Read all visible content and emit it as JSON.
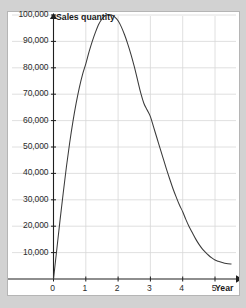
{
  "chart_data": {
    "type": "line",
    "title": "",
    "xlabel": "Year",
    "ylabel": "Sales quantity",
    "xlim": [
      -0.25,
      5.8
    ],
    "ylim": [
      0,
      105000
    ],
    "xticks": [
      "0",
      "1",
      "2",
      "3",
      "4",
      "5"
    ],
    "xtick_values": [
      0,
      1,
      2,
      3,
      4,
      5
    ],
    "yticks": [
      "10,000",
      "20,000",
      "30,000",
      "40,000",
      "50,000",
      "60,000",
      "70,000",
      "80,000",
      "90,000",
      "100,000"
    ],
    "ytick_values": [
      10000,
      20000,
      30000,
      40000,
      50000,
      60000,
      70000,
      80000,
      90000,
      100000
    ],
    "grid": true,
    "legend": "none",
    "series": [
      {
        "name": "Sales quantity",
        "color": "#3a3a3a",
        "x": [
          0.0,
          0.1,
          0.2,
          0.3,
          0.4,
          0.5,
          0.6,
          0.7,
          0.8,
          0.9,
          1.0,
          1.1,
          1.2,
          1.3,
          1.4,
          1.5,
          1.6,
          1.7,
          1.8,
          1.9,
          2.0,
          2.1,
          2.2,
          2.3,
          2.4,
          2.5,
          2.6,
          2.7,
          2.8,
          2.9,
          3.0,
          3.1,
          3.2,
          3.3,
          3.4,
          3.5,
          3.6,
          3.7,
          3.8,
          3.9,
          4.0,
          4.1,
          4.2,
          4.3,
          4.4,
          4.5,
          4.6,
          4.7,
          4.8,
          4.9,
          5.0,
          5.1,
          5.2,
          5.3,
          5.4,
          5.5
        ],
        "y": [
          0,
          11000,
          22000,
          32500,
          42500,
          51500,
          59500,
          66500,
          72500,
          77500,
          81500,
          86000,
          90000,
          93500,
          96500,
          98500,
          99800,
          100200,
          100000,
          99200,
          97800,
          95500,
          92500,
          89000,
          85000,
          80500,
          75500,
          70500,
          66500,
          64000,
          61500,
          57500,
          53500,
          49500,
          45500,
          41500,
          37800,
          34200,
          31000,
          28000,
          25500,
          22500,
          19800,
          17500,
          15200,
          13200,
          11500,
          10200,
          9000,
          8000,
          7200,
          6700,
          6300,
          6000,
          5800,
          5700
        ]
      }
    ],
    "peak": {
      "x": 1.85,
      "y": 100000
    }
  },
  "axis_titles": {
    "y": "Sales quantity",
    "x": "Year"
  },
  "colors": {
    "background": "#d2d2d2",
    "panel": "#ffffff",
    "panel_border": "#b5b5b5",
    "grid": "#d8d8d8",
    "axis": "#1f1f1f",
    "curve": "#3a3a3a",
    "text": "#2b2b2b"
  }
}
